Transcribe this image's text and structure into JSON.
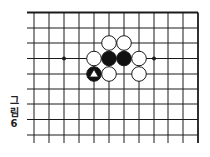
{
  "diagram": {
    "type": "go-board-fragment",
    "caption": {
      "line1": "그",
      "line2": "림",
      "line3": "6"
    },
    "grid": {
      "columns": 12,
      "rows": 9,
      "x_positions": [
        34,
        49,
        64,
        79,
        94,
        109,
        124,
        139,
        154,
        168,
        183,
        198
      ],
      "y_positions": [
        12.5,
        28,
        43,
        58.5,
        74,
        89,
        104,
        119.5,
        135
      ],
      "left_extent": 27,
      "bottom_extent": 143,
      "edges": {
        "top": true,
        "right": true,
        "left": false,
        "bottom": false
      }
    },
    "star_points": [
      {
        "col": 2,
        "row": 3
      },
      {
        "col": 8,
        "row": 3
      }
    ],
    "stones": [
      {
        "col": 5,
        "row": 2,
        "color": "white"
      },
      {
        "col": 6,
        "row": 2,
        "color": "white"
      },
      {
        "col": 4,
        "row": 3,
        "color": "white"
      },
      {
        "col": 5,
        "row": 3,
        "color": "black"
      },
      {
        "col": 6,
        "row": 3,
        "color": "black"
      },
      {
        "col": 7,
        "row": 3,
        "color": "white"
      },
      {
        "col": 4,
        "row": 4,
        "color": "black",
        "marker": "triangle"
      },
      {
        "col": 5,
        "row": 4,
        "color": "white"
      },
      {
        "col": 7,
        "row": 4,
        "color": "white"
      }
    ],
    "colors": {
      "line": "#1a1a1a",
      "black_stone": "#111111",
      "white_stone": "#ffffff",
      "marker": "#ffffff"
    }
  }
}
